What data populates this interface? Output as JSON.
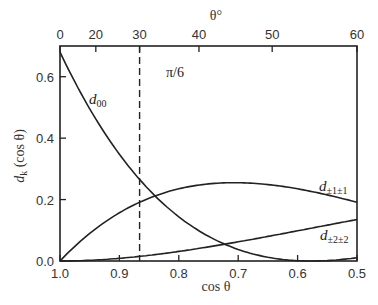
{
  "chart_data": {
    "type": "line",
    "title": "",
    "xlabel": "cos θ",
    "ylabel": "d_k (cos θ)",
    "x2label": "θ°",
    "xlim": [
      1.0,
      0.5
    ],
    "ylim": [
      0.0,
      0.7
    ],
    "xticks": [
      "1.0",
      "0.9",
      "0.8",
      "0.7",
      "0.6",
      "0.5"
    ],
    "yticks": [
      "0.0",
      "0.2",
      "0.4",
      "0.6"
    ],
    "x2ticks": [
      "0",
      "20",
      "30",
      "40",
      "50",
      "60"
    ],
    "grid": false,
    "annotations": [
      {
        "text": "π/6",
        "x": 0.866,
        "style": "dashed vertical line"
      }
    ],
    "x": [
      1.0,
      0.95,
      0.9,
      0.866,
      0.85,
      0.8,
      0.75,
      0.7,
      0.65,
      0.6,
      0.55,
      0.5
    ],
    "series": [
      {
        "name": "d00",
        "label": "d",
        "sub": "00",
        "values": [
          0.68,
          0.5,
          0.35,
          0.27,
          0.23,
          0.14,
          0.07,
          0.03,
          0.01,
          0.0,
          0.0,
          0.01
        ]
      },
      {
        "name": "d±1±1",
        "label": "d",
        "sub": "±1±1",
        "values": [
          0.0,
          0.09,
          0.16,
          0.19,
          0.21,
          0.24,
          0.25,
          0.255,
          0.25,
          0.235,
          0.21,
          0.18
        ]
      },
      {
        "name": "d±2±2",
        "label": "d",
        "sub": "±2±2",
        "values": [
          0.0,
          0.002,
          0.009,
          0.016,
          0.02,
          0.03,
          0.046,
          0.062,
          0.08,
          0.098,
          0.117,
          0.135
        ]
      }
    ]
  },
  "labels": {
    "xlabel": "cos θ",
    "ylabel": "d",
    "ylabel_sub": "k",
    "ylabel_rest": " (cos θ)",
    "x2label": "θ°",
    "pi6": "π/6",
    "d00": "d",
    "d00_sub": "00",
    "d11": "d",
    "d11_sub": "±1±1",
    "d22": "d",
    "d22_sub": "±2±2"
  }
}
